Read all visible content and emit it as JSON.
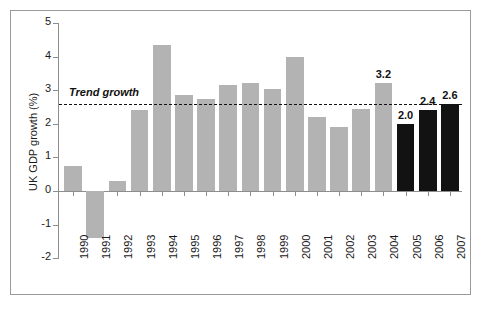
{
  "chart_data": {
    "type": "bar",
    "title": "",
    "xlabel": "",
    "ylabel": "UK GDP growth (%)",
    "categories": [
      "1990",
      "1991",
      "1992",
      "1993",
      "1994",
      "1995",
      "1996",
      "1997",
      "1998",
      "1999",
      "2000",
      "2001",
      "2002",
      "2003",
      "2004",
      "2005",
      "2006",
      "2007"
    ],
    "values": [
      0.75,
      -1.4,
      0.3,
      2.4,
      4.35,
      2.85,
      2.75,
      3.15,
      3.2,
      3.05,
      4.0,
      2.2,
      1.9,
      2.45,
      3.2,
      2.0,
      2.4,
      2.6
    ],
    "bar_colors": [
      "#b3b3b3",
      "#b3b3b3",
      "#b3b3b3",
      "#b3b3b3",
      "#b3b3b3",
      "#b3b3b3",
      "#b3b3b3",
      "#b3b3b3",
      "#b3b3b3",
      "#b3b3b3",
      "#b3b3b3",
      "#b3b3b3",
      "#b3b3b3",
      "#b3b3b3",
      "#b3b3b3",
      "#121212",
      "#121212",
      "#121212"
    ],
    "data_labels": [
      "",
      "",
      "",
      "",
      "",
      "",
      "",
      "",
      "",
      "",
      "",
      "",
      "",
      "",
      "3.2",
      "2.0",
      "2.4",
      "2.6"
    ],
    "ylim": [
      -2,
      5
    ],
    "yticks": [
      5,
      4,
      3,
      2,
      1,
      0,
      -1,
      -2
    ],
    "ytick_labels": [
      "5",
      "4",
      "3",
      "2",
      "1",
      "0",
      "-1",
      "-2"
    ],
    "grid": false,
    "legend": "none",
    "annotations": [
      {
        "name": "trend-growth",
        "label": "Trend growth",
        "value": 2.6,
        "style": "dashed-horizontal-line"
      }
    ],
    "colors": {
      "historic_bar": "#b3b3b3",
      "forecast_bar": "#121212",
      "axis": "#8d8d8d",
      "text": "#1a1a1a",
      "trend_line": "#111111"
    }
  }
}
